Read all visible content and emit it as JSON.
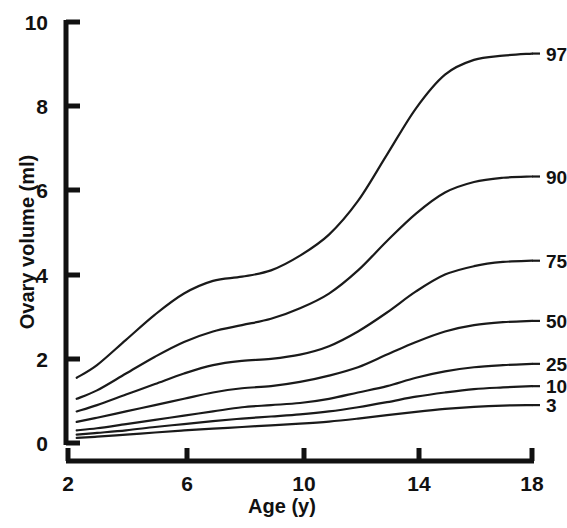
{
  "chart_data": {
    "type": "line",
    "title": "",
    "xlabel": "Age (y)",
    "ylabel": "Ovary volume (ml)",
    "xlim": [
      2,
      18
    ],
    "ylim": [
      0,
      10
    ],
    "xticks": [
      2,
      6,
      10,
      14,
      18
    ],
    "yticks": [
      0,
      2,
      4,
      6,
      8,
      10
    ],
    "grid": false,
    "legend_position": "right-inline-labels",
    "x": [
      2.3,
      3,
      4,
      5,
      6,
      7,
      8,
      9,
      10,
      11,
      12,
      13,
      14,
      15,
      16,
      17,
      18
    ],
    "series": [
      {
        "name": "97",
        "label": "97",
        "values": [
          1.55,
          1.85,
          2.45,
          3.05,
          3.55,
          3.85,
          3.95,
          4.1,
          4.45,
          4.95,
          5.75,
          6.85,
          7.95,
          8.75,
          9.1,
          9.2,
          9.25
        ]
      },
      {
        "name": "90",
        "label": "90",
        "values": [
          1.05,
          1.25,
          1.65,
          2.05,
          2.4,
          2.65,
          2.8,
          2.95,
          3.2,
          3.55,
          4.1,
          4.8,
          5.45,
          5.95,
          6.2,
          6.3,
          6.33
        ]
      },
      {
        "name": "75",
        "label": "75",
        "values": [
          0.75,
          0.9,
          1.15,
          1.4,
          1.65,
          1.85,
          1.95,
          2.0,
          2.1,
          2.3,
          2.65,
          3.1,
          3.6,
          4.0,
          4.2,
          4.3,
          4.33
        ]
      },
      {
        "name": "50",
        "label": "50",
        "values": [
          0.5,
          0.6,
          0.75,
          0.9,
          1.05,
          1.2,
          1.3,
          1.35,
          1.45,
          1.6,
          1.8,
          2.1,
          2.4,
          2.65,
          2.8,
          2.87,
          2.9
        ]
      },
      {
        "name": "25",
        "label": "25",
        "values": [
          0.3,
          0.35,
          0.45,
          0.55,
          0.65,
          0.75,
          0.85,
          0.9,
          0.95,
          1.05,
          1.2,
          1.35,
          1.55,
          1.7,
          1.8,
          1.85,
          1.88
        ]
      },
      {
        "name": "10",
        "label": "10",
        "values": [
          0.2,
          0.24,
          0.3,
          0.38,
          0.45,
          0.52,
          0.58,
          0.63,
          0.68,
          0.75,
          0.85,
          0.97,
          1.1,
          1.2,
          1.28,
          1.32,
          1.35
        ]
      },
      {
        "name": "3",
        "label": "3",
        "values": [
          0.12,
          0.15,
          0.2,
          0.25,
          0.3,
          0.34,
          0.38,
          0.42,
          0.46,
          0.51,
          0.58,
          0.66,
          0.74,
          0.81,
          0.86,
          0.89,
          0.9
        ]
      }
    ]
  },
  "axes": {
    "x_title": "Age (y)",
    "y_title": "Ovary volume (ml)",
    "x_tick_labels": [
      "2",
      "6",
      "10",
      "14",
      "18"
    ],
    "y_tick_labels": [
      "0",
      "2",
      "4",
      "6",
      "8",
      "10"
    ]
  },
  "series_labels": [
    "97",
    "90",
    "75",
    "50",
    "25",
    "10",
    "3"
  ],
  "colors": {
    "background": "#ffffff",
    "axis": "#111111",
    "curve": "#1a1a1a",
    "text": "#111111"
  }
}
